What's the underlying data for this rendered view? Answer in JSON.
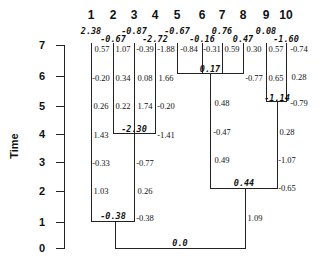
{
  "axis": {
    "title": "Time",
    "ticks": [
      {
        "label": "7",
        "y": 45
      },
      {
        "label": "6",
        "y": 76
      },
      {
        "label": "5",
        "y": 106
      },
      {
        "label": "4",
        "y": 134
      },
      {
        "label": "3",
        "y": 162
      },
      {
        "label": "2",
        "y": 191
      },
      {
        "label": "1",
        "y": 222
      },
      {
        "label": "0",
        "y": 248
      }
    ]
  },
  "leaves": [
    {
      "label": "1",
      "x": 91
    },
    {
      "label": "2",
      "x": 113
    },
    {
      "label": "3",
      "x": 134
    },
    {
      "label": "4",
      "x": 155
    },
    {
      "label": "5",
      "x": 177
    },
    {
      "label": "6",
      "x": 202
    },
    {
      "label": "7",
      "x": 222
    },
    {
      "label": "8",
      "x": 243
    },
    {
      "label": "9",
      "x": 266
    },
    {
      "label": "10",
      "x": 286
    }
  ],
  "leaf_values": [
    {
      "label": "2.38",
      "x": 91,
      "y": 26
    },
    {
      "label": "-0.87",
      "x": 134,
      "y": 26
    },
    {
      "label": "-0.67",
      "x": 113,
      "y": 34
    },
    {
      "label": "-2.72",
      "x": 155,
      "y": 34
    },
    {
      "label": "-0.67",
      "x": 177,
      "y": 26
    },
    {
      "label": "0.76",
      "x": 222,
      "y": 26
    },
    {
      "label": "-0.16",
      "x": 202,
      "y": 34
    },
    {
      "label": "0.47",
      "x": 243,
      "y": 34
    },
    {
      "label": "0.08",
      "x": 266,
      "y": 26
    },
    {
      "label": "-1.60",
      "x": 286,
      "y": 34
    }
  ],
  "internal_nodes": [
    {
      "label": "-2.30",
      "x": 134,
      "y": 124
    },
    {
      "label": "-0.38",
      "x": 113,
      "y": 211
    },
    {
      "label": "0.17",
      "x": 210,
      "y": 64
    },
    {
      "label": "-1.14",
      "x": 277,
      "y": 93
    },
    {
      "label": "0.44",
      "x": 244,
      "y": 178
    },
    {
      "label": "0.0",
      "x": 180,
      "y": 238
    }
  ],
  "cells": [
    {
      "label": "0.57",
      "x": 102,
      "y": 44
    },
    {
      "label": "1.07",
      "x": 123,
      "y": 44
    },
    {
      "label": "-0.39",
      "x": 145,
      "y": 44
    },
    {
      "label": "-1.88",
      "x": 166,
      "y": 44
    },
    {
      "label": "-0.84",
      "x": 189,
      "y": 44
    },
    {
      "label": "-0.31",
      "x": 212,
      "y": 44
    },
    {
      "label": "0.59",
      "x": 232,
      "y": 44
    },
    {
      "label": "0.30",
      "x": 254,
      "y": 44
    },
    {
      "label": "0.57",
      "x": 276,
      "y": 44
    },
    {
      "label": "-0.74",
      "x": 299,
      "y": 44
    },
    {
      "label": "-0.20",
      "x": 101,
      "y": 73
    },
    {
      "label": "0.34",
      "x": 123,
      "y": 73
    },
    {
      "label": "0.08",
      "x": 145,
      "y": 73
    },
    {
      "label": "1.66",
      "x": 166,
      "y": 73
    },
    {
      "label": "-0.77",
      "x": 254,
      "y": 73
    },
    {
      "label": "0.65",
      "x": 276,
      "y": 73
    },
    {
      "label": "0.28",
      "x": 299,
      "y": 72
    },
    {
      "label": "0.26",
      "x": 101,
      "y": 101
    },
    {
      "label": "0.22",
      "x": 123,
      "y": 101
    },
    {
      "label": "1.74",
      "x": 145,
      "y": 101
    },
    {
      "label": "-0.20",
      "x": 166,
      "y": 101
    },
    {
      "label": "0.48",
      "x": 222,
      "y": 98
    },
    {
      "label": "-0.79",
      "x": 299,
      "y": 98
    },
    {
      "label": "1.43",
      "x": 101,
      "y": 130
    },
    {
      "label": "-1.41",
      "x": 166,
      "y": 130
    },
    {
      "label": "-0.47",
      "x": 222,
      "y": 127
    },
    {
      "label": "0.28",
      "x": 287,
      "y": 127
    },
    {
      "label": "-0.33",
      "x": 101,
      "y": 158
    },
    {
      "label": "-0.77",
      "x": 145,
      "y": 158
    },
    {
      "label": "0.49",
      "x": 222,
      "y": 155
    },
    {
      "label": "-1.07",
      "x": 287,
      "y": 155
    },
    {
      "label": "1.03",
      "x": 101,
      "y": 186
    },
    {
      "label": "0.26",
      "x": 145,
      "y": 186
    },
    {
      "label": "-0.65",
      "x": 287,
      "y": 183
    },
    {
      "label": "-0.38",
      "x": 145,
      "y": 213
    },
    {
      "label": "1.09",
      "x": 255,
      "y": 213
    }
  ]
}
